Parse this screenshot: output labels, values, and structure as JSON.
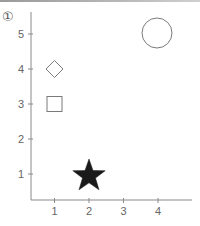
{
  "figure": {
    "panel_label": "①"
  },
  "colors": {
    "axis": "#8a8a8a",
    "marker_outline": "#7a7a7a",
    "marker_fill_dark": "#1a1a1a",
    "tick_text": "#666666"
  },
  "chart_data": {
    "type": "scatter",
    "title": "",
    "xlabel": "",
    "ylabel": "",
    "xlim": [
      0,
      5
    ],
    "ylim": [
      0,
      5.5
    ],
    "x_ticks": [
      1,
      2,
      3,
      4
    ],
    "y_ticks": [
      1,
      2,
      3,
      4,
      5
    ],
    "grid": false,
    "legend": null,
    "points": [
      {
        "x": 1,
        "y": 4,
        "marker": "diamond",
        "filled": false,
        "size": "small"
      },
      {
        "x": 1,
        "y": 3,
        "marker": "square",
        "filled": false,
        "size": "small"
      },
      {
        "x": 2,
        "y": 1,
        "marker": "star",
        "filled": true,
        "size": "large"
      },
      {
        "x": 4,
        "y": 5,
        "marker": "circle",
        "filled": false,
        "size": "large"
      }
    ]
  }
}
